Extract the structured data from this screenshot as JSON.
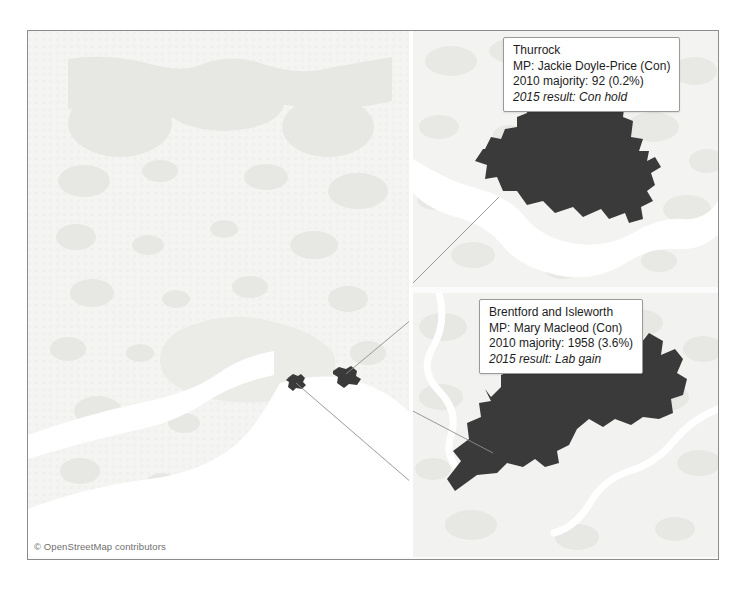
{
  "figure": {
    "attribution": "© OpenStreetMap contributors",
    "colors": {
      "constituency_fill": "#3a3a3a",
      "land": "#f2f2f0",
      "urban_patch": "#e4e4e2",
      "water": "#ffffff",
      "frame_border": "#8c8c8c",
      "leader_line": "#8f8f8f",
      "callout_border": "#9a9a9a",
      "text": "#1d1d1d"
    }
  },
  "main_map": {
    "name": "greater-london-and-thames-estuary-overview",
    "markers": [
      {
        "name": "brentford-and-isleworth-marker",
        "x": 265,
        "y": 352
      },
      {
        "name": "thurrock-marker",
        "x": 312,
        "y": 348
      }
    ]
  },
  "insets": [
    {
      "id": "thurrock",
      "callout": {
        "title": "Thurrock",
        "mp": "MP: Jackie Doyle-Price (Con)",
        "majority": "2010 majority: 92 (0.2%)",
        "result": "2015 result: Con hold"
      },
      "data": {
        "constituency": "Thurrock",
        "mp_name": "Jackie Doyle-Price",
        "mp_party": "Con",
        "majority_2010": 92,
        "majority_2010_pct": "0.2%",
        "result_2015": "Con hold"
      }
    },
    {
      "id": "brentford-and-isleworth",
      "callout": {
        "title": "Brentford and Isleworth",
        "mp": "MP: Mary Macleod (Con)",
        "majority": "2010 majority: 1958 (3.6%)",
        "result": "2015 result: Lab gain"
      },
      "data": {
        "constituency": "Brentford and Isleworth",
        "mp_name": "Mary Macleod",
        "mp_party": "Con",
        "majority_2010": 1958,
        "majority_2010_pct": "3.6%",
        "result_2015": "Lab gain"
      }
    }
  ]
}
